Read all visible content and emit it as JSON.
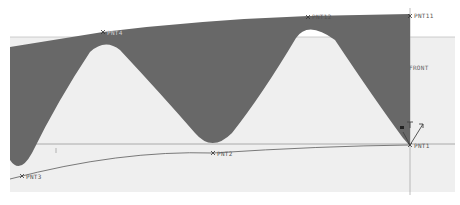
{
  "viewport": {
    "background": "#ffffff",
    "plane_fill": "#efefef",
    "shape_fill": "#686868",
    "line_color": "#8a8a8a",
    "curve_color": "#555555"
  },
  "datum_plane": {
    "label": "FRONT"
  },
  "datum_points": [
    {
      "label": "PNT4",
      "x": 103,
      "y": 32
    },
    {
      "label": "PNT12",
      "x": 308,
      "y": 17
    },
    {
      "label": "PNT11",
      "x": 410,
      "y": 16
    },
    {
      "label": "PNT2",
      "x": 213,
      "y": 153
    },
    {
      "label": "PNT3",
      "x": 22,
      "y": 176
    },
    {
      "label": "PNT1",
      "x": 410,
      "y": 145
    }
  ],
  "csys": {
    "label": "CS0"
  }
}
